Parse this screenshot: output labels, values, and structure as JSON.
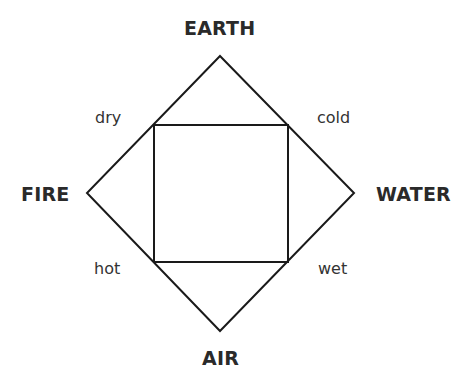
{
  "diagram": {
    "type": "square-of-opposition-elements",
    "stroke_color": "#1a1a1a",
    "elements": {
      "top": "EARTH",
      "left": "FIRE",
      "right": "WATER",
      "bottom": "AIR"
    },
    "qualities": {
      "top_left": "dry",
      "top_right": "cold",
      "bottom_left": "hot",
      "bottom_right": "wet"
    },
    "shapes": {
      "diamond": [
        [
          220,
          56
        ],
        [
          354,
          193
        ],
        [
          220,
          331
        ],
        [
          87,
          193
        ]
      ],
      "inner_square": [
        [
          154,
          125
        ],
        [
          288,
          125
        ],
        [
          288,
          262
        ],
        [
          154,
          262
        ]
      ]
    }
  }
}
